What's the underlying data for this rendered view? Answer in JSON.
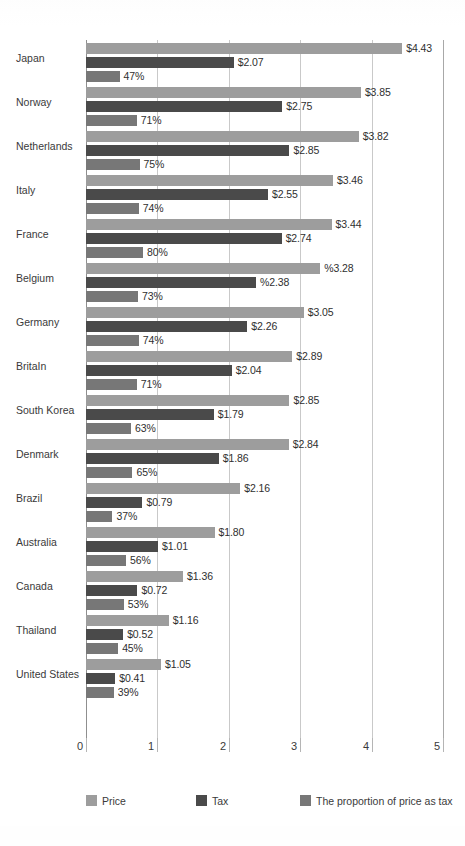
{
  "chart_data": {
    "type": "bar",
    "title": "",
    "subtitle": "",
    "xlabel": "",
    "ylabel": "",
    "orientation": "horizontal",
    "grouped": true,
    "grid": true,
    "xlim": [
      0,
      5
    ],
    "xticks": [
      "0",
      "1",
      "2",
      "3",
      "4",
      "5"
    ],
    "legend_position": "bottom",
    "categories": [
      "Japan",
      "Norway",
      "Netherlands",
      "Italy",
      "France",
      "Belgium",
      "Germany",
      "BritaIn",
      "South Korea",
      "Denmark",
      "Brazil",
      "Australia",
      "Canada",
      "Thailand",
      "United States"
    ],
    "series": [
      {
        "name": "Price",
        "color": "#9d9d9d",
        "values": [
          4.43,
          3.85,
          3.82,
          3.46,
          3.44,
          3.28,
          3.05,
          2.89,
          2.85,
          2.84,
          2.16,
          1.8,
          1.36,
          1.16,
          1.05
        ],
        "labels": [
          "$4.43",
          "$3.85",
          "$3.82",
          "$3.46",
          "$3.44",
          "%3.28",
          "$3.05",
          "$2.89",
          "$2.85",
          "$2.84",
          "$2.16",
          "$1.80",
          "$1.36",
          "$1.16",
          "$1.05"
        ]
      },
      {
        "name": "Tax",
        "color": "#4a4a4a",
        "values": [
          2.07,
          2.75,
          2.85,
          2.55,
          2.74,
          2.38,
          2.26,
          2.04,
          1.79,
          1.86,
          0.79,
          1.01,
          0.72,
          0.52,
          0.41
        ],
        "labels": [
          "$2.07",
          "$2.75",
          "$2.85",
          "$2.55",
          "$2.74",
          "%2.38",
          "$2.26",
          "$2.04",
          "$1.79",
          "$1.86",
          "$0.79",
          "$1.01",
          "$0.72",
          "$0.52",
          "$0.41"
        ]
      },
      {
        "name": "The proportion of price as tax",
        "color": "#777777",
        "values": [
          47,
          71,
          75,
          74,
          80,
          73,
          74,
          71,
          63,
          65,
          37,
          56,
          53,
          45,
          39
        ],
        "labels": [
          "47%",
          "71%",
          "75%",
          "74%",
          "80%",
          "73%",
          "74%",
          "71%",
          "63%",
          "65%",
          "37%",
          "56%",
          "53%",
          "45%",
          "39%"
        ]
      }
    ]
  },
  "legend": {
    "price_label": "Price",
    "tax_label": "Tax",
    "proportion_label": "The proportion of price as tax"
  },
  "axis": {
    "tick_0": "0",
    "tick_1": "1",
    "tick_2": "2",
    "tick_3": "3",
    "tick_4": "4",
    "tick_5": "5"
  }
}
